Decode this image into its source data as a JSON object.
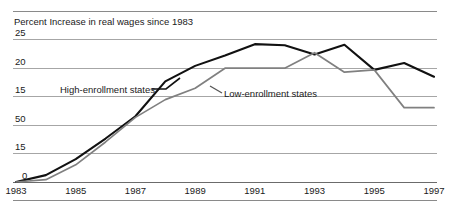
{
  "chart_data": {
    "type": "line",
    "title": "Percent Increase in real wages since 1983",
    "xlabel": "",
    "ylabel": "",
    "grid": true,
    "legend_position": "inline-annotations",
    "x": [
      1983,
      1984,
      1985,
      1986,
      1987,
      1988,
      1989,
      1990,
      1991,
      1992,
      1993,
      1994,
      1995,
      1996,
      1997
    ],
    "xtick_labels": [
      "1983",
      "1985",
      "1987",
      "1989",
      "1991",
      "1993",
      "1995",
      "1997"
    ],
    "ytick_labels": [
      "25",
      "20",
      "15",
      "50",
      "15",
      "0"
    ],
    "ytick_values": [
      25,
      20,
      15,
      10,
      5,
      0
    ],
    "ylim": [
      0,
      25
    ],
    "xlim": [
      1983,
      1997
    ],
    "series": [
      {
        "name": "High-enrollment states",
        "color": "#111111",
        "values": [
          0.0,
          1.2,
          4.0,
          7.6,
          11.5,
          17.6,
          20.3,
          22.1,
          24.1,
          23.9,
          22.3,
          24.0,
          19.6,
          20.8,
          18.4
        ]
      },
      {
        "name": "Low-enrollment states",
        "color": "#808080",
        "values": [
          0.0,
          0.4,
          3.0,
          7.0,
          11.3,
          14.4,
          16.4,
          19.9,
          19.9,
          19.9,
          22.6,
          19.2,
          19.6,
          13.0,
          13.0
        ]
      }
    ],
    "annotations": [
      {
        "text": "High-enrollment states",
        "series": "High-enrollment states"
      },
      {
        "text": "Low-enrollment states",
        "series": "Low-enrollment states"
      }
    ]
  }
}
